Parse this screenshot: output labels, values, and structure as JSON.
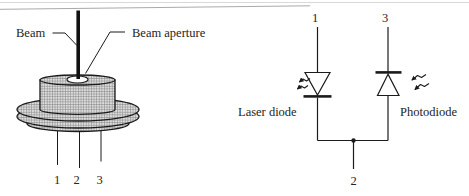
{
  "package": {
    "beam_label": "Beam",
    "aperture_label": "Beam aperture",
    "pins": [
      "1",
      "2",
      "3"
    ]
  },
  "circuit": {
    "pin_top_left": "1",
    "pin_top_right": "3",
    "pin_bottom": "2",
    "laser_diode_label": "Laser diode",
    "photodiode_label": "Photodiode"
  },
  "colors": {
    "line": "#1b1b1b",
    "hatch_fill": "#dedede",
    "hatch_grid": "#909090",
    "background": "#ffffff"
  }
}
